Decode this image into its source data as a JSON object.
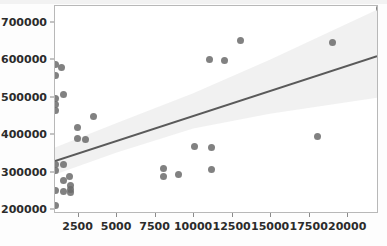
{
  "chart_data": {
    "type": "scatter",
    "title": "",
    "xlabel": "",
    "ylabel": "",
    "xlim": [
      970,
      22000
    ],
    "ylim": [
      190000,
      745000
    ],
    "grid": false,
    "legend": null,
    "xticks": [
      2500,
      5000,
      7500,
      10000,
      12500,
      15000,
      17500,
      20000
    ],
    "xtick_labels": [
      "2500",
      "5000",
      "7500",
      "10000",
      "12500",
      "15000",
      "17500",
      "20000"
    ],
    "yticks": [
      200000,
      300000,
      400000,
      500000,
      600000,
      700000
    ],
    "ytick_labels": [
      "200000",
      "300000",
      "400000",
      "500000",
      "600000",
      "700000"
    ],
    "marker_color": "#6b6b6b",
    "line_color": "#5a5a5a",
    "band_color": "#ececec",
    "points": [
      {
        "x": 1000,
        "y": 590000
      },
      {
        "x": 1000,
        "y": 560000
      },
      {
        "x": 1000,
        "y": 497000
      },
      {
        "x": 1000,
        "y": 482000
      },
      {
        "x": 1000,
        "y": 467000
      },
      {
        "x": 1000,
        "y": 322000
      },
      {
        "x": 1000,
        "y": 305000
      },
      {
        "x": 1000,
        "y": 252000
      },
      {
        "x": 1000,
        "y": 212000
      },
      {
        "x": 1400,
        "y": 582000
      },
      {
        "x": 1500,
        "y": 510000
      },
      {
        "x": 1500,
        "y": 322000
      },
      {
        "x": 1500,
        "y": 280000
      },
      {
        "x": 1500,
        "y": 250000
      },
      {
        "x": 1900,
        "y": 290000
      },
      {
        "x": 1950,
        "y": 265000
      },
      {
        "x": 1950,
        "y": 255000
      },
      {
        "x": 1950,
        "y": 248000
      },
      {
        "x": 2450,
        "y": 420000
      },
      {
        "x": 2450,
        "y": 392000
      },
      {
        "x": 2950,
        "y": 390000
      },
      {
        "x": 3500,
        "y": 450000
      },
      {
        "x": 8000,
        "y": 312000
      },
      {
        "x": 8000,
        "y": 289000
      },
      {
        "x": 9000,
        "y": 296000
      },
      {
        "x": 10000,
        "y": 369000
      },
      {
        "x": 11000,
        "y": 603000
      },
      {
        "x": 11100,
        "y": 368000
      },
      {
        "x": 11100,
        "y": 309000
      },
      {
        "x": 12000,
        "y": 600000
      },
      {
        "x": 13000,
        "y": 652000
      },
      {
        "x": 18000,
        "y": 397000
      },
      {
        "x": 19000,
        "y": 648000
      },
      {
        "x": 22000,
        "y": 737000
      }
    ],
    "regression": {
      "x_start": 970,
      "y_start": 327000,
      "x_end": 22000,
      "y_end": 610000
    },
    "confidence_band": {
      "upper": [
        {
          "x": 970,
          "y": 364000
        },
        {
          "x": 5000,
          "y": 430000
        },
        {
          "x": 10000,
          "y": 510000
        },
        {
          "x": 15000,
          "y": 600000
        },
        {
          "x": 22000,
          "y": 735000
        }
      ],
      "lower": [
        {
          "x": 970,
          "y": 291000
        },
        {
          "x": 5000,
          "y": 350000
        },
        {
          "x": 10000,
          "y": 415000
        },
        {
          "x": 15000,
          "y": 455000
        },
        {
          "x": 22000,
          "y": 498000
        }
      ]
    }
  }
}
